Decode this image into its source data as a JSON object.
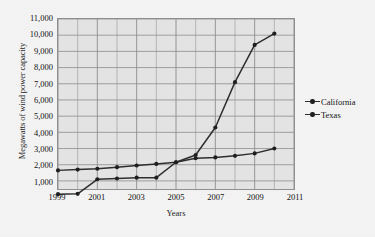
{
  "chart_data": {
    "type": "line",
    "title": "",
    "xlabel": "Years",
    "ylabel": "Megawatts of wind power capacity",
    "x": [
      1999,
      2000,
      2001,
      2002,
      2003,
      2004,
      2005,
      2006,
      2007,
      2008,
      2009,
      2010
    ],
    "xlim": [
      1999,
      2011
    ],
    "ylim": [
      500,
      11000
    ],
    "xticks": [
      1999,
      2001,
      2003,
      2005,
      2007,
      2009,
      2011
    ],
    "xtick_labels": [
      "1999",
      "2001",
      "2003",
      "2005",
      "2007",
      "2009",
      "2011"
    ],
    "yticks": [
      1000,
      2000,
      3000,
      4000,
      5000,
      6000,
      7000,
      8000,
      9000,
      10000,
      11000
    ],
    "ytick_labels": [
      "1,000",
      "2,000",
      "3,000",
      "4,000",
      "5,000",
      "6,000",
      "7,000",
      "8,000",
      "9,000",
      "10,000",
      "11,000"
    ],
    "grid": true,
    "legend_position": "right",
    "series": [
      {
        "name": "California",
        "color": "#2e2e2e",
        "values": [
          1650,
          1700,
          1750,
          1850,
          1950,
          2050,
          2150,
          2400,
          2450,
          2550,
          2700,
          3000
        ]
      },
      {
        "name": "Texas",
        "color": "#2e2e2e",
        "values": [
          180,
          200,
          1100,
          1150,
          1200,
          1200,
          2150,
          2600,
          4300,
          7100,
          9400,
          10100
        ]
      }
    ]
  },
  "legend": {
    "items": [
      {
        "label": "California"
      },
      {
        "label": "Texas"
      }
    ]
  },
  "axes": {
    "x_title": "Years",
    "y_title": "Megawatts of wind power capacity"
  }
}
